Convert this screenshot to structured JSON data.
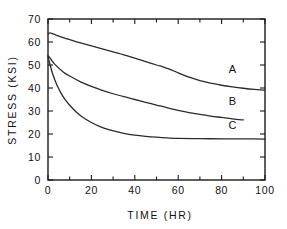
{
  "chart_data": {
    "type": "line",
    "title": "",
    "xlabel": "TIME (HR)",
    "ylabel": "STRESS (KSI)",
    "xlim": [
      0,
      100
    ],
    "ylim": [
      0,
      70
    ],
    "xticks": [
      0,
      20,
      40,
      60,
      80,
      100
    ],
    "xtick_labels": [
      "0",
      "20",
      "40",
      "60",
      "80",
      "100"
    ],
    "xminor_step": 10,
    "yticks": [
      0,
      10,
      20,
      30,
      40,
      50,
      60,
      70
    ],
    "ytick_labels": [
      "0",
      "10",
      "20",
      "30",
      "40",
      "50",
      "60",
      "70"
    ],
    "grid": false,
    "legend": "inline-labels",
    "frame": "box-all-sides-inward-ticks",
    "line_color": "#2b2b2b",
    "series": [
      {
        "name": "A",
        "label_position": {
          "x": 85,
          "y": 46.5
        },
        "x": [
          0,
          1,
          2,
          4,
          7,
          10,
          15,
          20,
          25,
          30,
          35,
          40,
          45,
          50,
          53,
          56,
          60,
          65,
          70,
          75,
          80,
          85,
          90,
          95,
          100
        ],
        "values": [
          63.5,
          64.0,
          63.6,
          62.9,
          61.9,
          61.0,
          59.6,
          58.3,
          57.0,
          55.7,
          54.4,
          53.0,
          51.5,
          50.0,
          49.2,
          48.2,
          46.6,
          44.7,
          43.2,
          42.1,
          41.2,
          40.5,
          39.9,
          39.4,
          39.0
        ]
      },
      {
        "name": "B",
        "label_position": {
          "x": 85,
          "y": 32.5
        },
        "x": [
          0,
          1,
          2,
          4,
          7,
          10,
          15,
          20,
          25,
          30,
          35,
          40,
          45,
          50,
          55,
          60,
          65,
          70,
          75,
          80,
          85,
          90
        ],
        "values": [
          54.0,
          53.0,
          51.6,
          49.5,
          47.0,
          45.2,
          42.7,
          40.7,
          39.0,
          37.5,
          36.2,
          35.0,
          33.8,
          32.6,
          31.4,
          30.3,
          29.3,
          28.5,
          27.8,
          27.2,
          26.6,
          26.1
        ]
      },
      {
        "name": "C",
        "label_position": {
          "x": 85,
          "y": 22.0
        },
        "x": [
          0,
          1,
          2,
          4,
          6,
          8,
          10,
          13,
          16,
          20,
          24,
          28,
          32,
          36,
          40,
          45,
          50,
          55,
          60,
          70,
          80,
          90,
          100
        ],
        "values": [
          53.5,
          50.0,
          46.5,
          41.5,
          37.8,
          34.8,
          32.5,
          29.6,
          27.3,
          25.0,
          23.2,
          21.9,
          20.9,
          20.1,
          19.5,
          19.0,
          18.6,
          18.3,
          18.1,
          18.0,
          17.9,
          17.9,
          17.8
        ]
      }
    ]
  }
}
